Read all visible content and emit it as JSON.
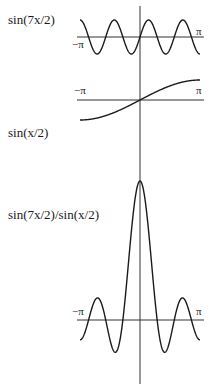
{
  "figure": {
    "labels": {
      "top": "sin(7x/2)",
      "middle": "sin(x/2)",
      "bottom": "sin(7x/2)/sin(x/2)"
    },
    "ticks": {
      "neg": "−π",
      "pos": "π"
    },
    "colors": {
      "curve": "#1a1a1a",
      "axis": "#333333"
    }
  },
  "chart_data": [
    {
      "type": "line",
      "title": "sin(7x/2)",
      "x_range": [
        -3.14159,
        3.14159
      ],
      "function": "sin(7x/2)",
      "xtick_labels": [
        "−π",
        "π"
      ],
      "ylim": [
        -1,
        1
      ],
      "grid": false
    },
    {
      "type": "line",
      "title": "sin(x/2)",
      "x_range": [
        -3.14159,
        3.14159
      ],
      "function": "sin(x/2)",
      "xtick_labels": [
        "−π",
        "π"
      ],
      "ylim": [
        -1,
        1
      ],
      "grid": false
    },
    {
      "type": "line",
      "title": "sin(7x/2)/sin(x/2)",
      "x_range": [
        -3.14159,
        3.14159
      ],
      "function": "sin(7x/2)/sin(x/2)",
      "xtick_labels": [
        "−π",
        "π"
      ],
      "ylim": [
        -1.6,
        7
      ],
      "peak": {
        "x": 0,
        "y": 7
      },
      "grid": false
    }
  ]
}
